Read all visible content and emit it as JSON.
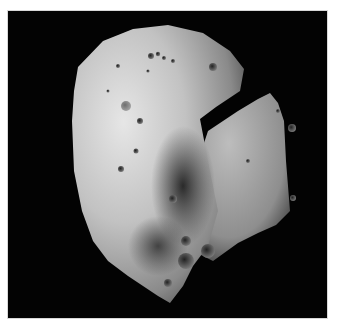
{
  "image": {
    "subject": "asteroid",
    "alt": "Grayscale photograph of a cratered, irregularly shaped asteroid against a black sky",
    "background_color": "#030303",
    "page_color": "#ffffff",
    "surface_light": "#e2e2e2",
    "surface_mid": "#a8a8a8",
    "surface_shadow": "#2a2a2a"
  }
}
